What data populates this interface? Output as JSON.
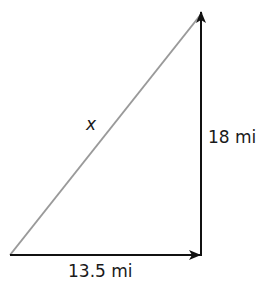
{
  "diagram": {
    "type": "right-triangle-vectors",
    "labels": {
      "hypotenuse": "x",
      "vertical_leg": "18 mi",
      "horizontal_leg": "13.5 mi"
    },
    "colors": {
      "hypotenuse": "#9a9a9a",
      "legs": "#111111",
      "background": "#ffffff"
    },
    "vertices": {
      "start": [
        10,
        255
      ],
      "corner": [
        201,
        255
      ],
      "end": [
        202,
        12
      ]
    }
  }
}
